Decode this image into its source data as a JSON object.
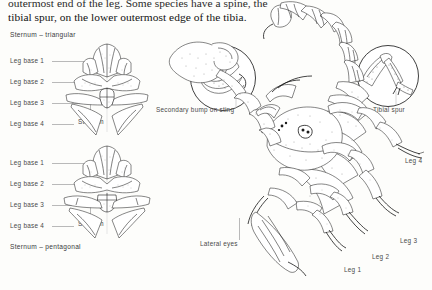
{
  "page": {
    "background": "#fdfdfb",
    "width": 432,
    "height": 290,
    "ink_color": "#1b1b1b",
    "label_color": "#4a4a4a"
  },
  "body_text": {
    "line1": "outermost end of the leg. Some species have a spine, the",
    "line2": "tibial spur, on the lower outermost edge of the tibia."
  },
  "figures": {
    "sternum_triangular": {
      "title": "Sternum – triangular",
      "callouts": [
        {
          "label": "Leg base 1"
        },
        {
          "label": "Leg base 2"
        },
        {
          "label": "Leg base 3"
        },
        {
          "label": "Leg base 4"
        }
      ],
      "inner_label": "Sternum"
    },
    "sternum_pentagonal": {
      "title": "Sternum – pentagonal",
      "callouts": [
        {
          "label": "Leg base 1"
        },
        {
          "label": "Leg base 2"
        },
        {
          "label": "Leg base 3"
        },
        {
          "label": "Leg base 4"
        }
      ],
      "inner_label": "Sternum"
    },
    "sting_detail": {
      "caption": "Secondary bump on sting"
    },
    "tibial_detail": {
      "caption": "Tibial spur"
    },
    "scorpion": {
      "callouts": [
        {
          "label": "Lateral eyes"
        },
        {
          "label": "Leg 4"
        },
        {
          "label": "Leg 3"
        },
        {
          "label": "Leg 2"
        },
        {
          "label": "Leg 1"
        }
      ]
    }
  }
}
